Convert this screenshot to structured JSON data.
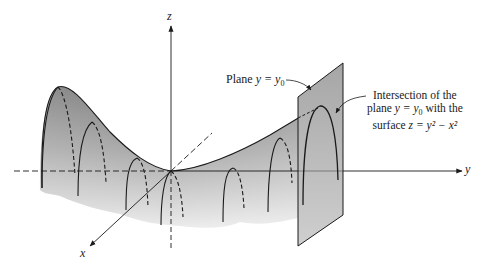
{
  "figure": {
    "axes": {
      "x_label": "x",
      "y_label": "y",
      "z_label": "z"
    },
    "annotations": {
      "plane_label_prefix": "Plane ",
      "plane_label_eq": "y = y",
      "plane_label_sub": "0",
      "intersection_line1": "Intersection of the",
      "intersection_line2_a": "plane ",
      "intersection_line2_eq": "y = y",
      "intersection_line2_sub": "0",
      "intersection_line2_b": " with the",
      "intersection_line3_a": "surface ",
      "intersection_line3_eq": "z = y² − x²"
    },
    "colors": {
      "ink": "#1a1a1a",
      "surface_dark": "#6e6e6e",
      "surface_light": "#e6e6e6",
      "plane_fill": "#b9b9b9"
    }
  }
}
